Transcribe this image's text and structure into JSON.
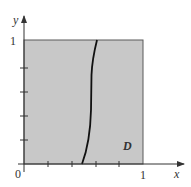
{
  "figure": {
    "type": "region-diagram",
    "region_label": "D",
    "x_axis": {
      "label": "x",
      "tick_labels": {
        "origin": "0",
        "end": "1"
      },
      "tick_count": 4
    },
    "y_axis": {
      "label": "y",
      "tick_labels": {
        "end": "1"
      },
      "tick_count": 4
    },
    "square": {
      "x_range": [
        0,
        1
      ],
      "y_range": [
        0,
        1
      ],
      "fill": "#c8c8c8",
      "stroke": "#555555"
    },
    "curve": {
      "description": "steep S-shaped curve crossing unit square near x≈0.6",
      "stroke": "#111111"
    }
  }
}
